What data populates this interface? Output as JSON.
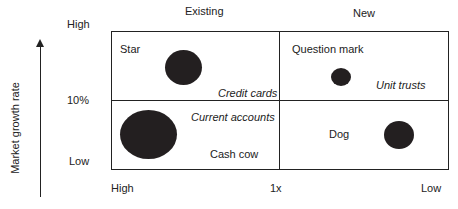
{
  "columns": {
    "left": "Existing",
    "right": "New"
  },
  "y_axis": {
    "label": "Market growth rate",
    "high": "High",
    "mid": "10%",
    "low": "Low"
  },
  "x_axis": {
    "high": "High",
    "mid": "1x",
    "low": "Low"
  },
  "quadrants": {
    "star": {
      "title": "Star",
      "product": "Credit cards"
    },
    "question_mark": {
      "title": "Question mark",
      "product": "Unit trusts"
    },
    "cash_cow": {
      "title": "Cash cow",
      "product": "Current accounts"
    },
    "dog": {
      "title": "Dog",
      "product": ""
    }
  },
  "colors": {
    "dot": "#231f20",
    "line": "#222222"
  }
}
